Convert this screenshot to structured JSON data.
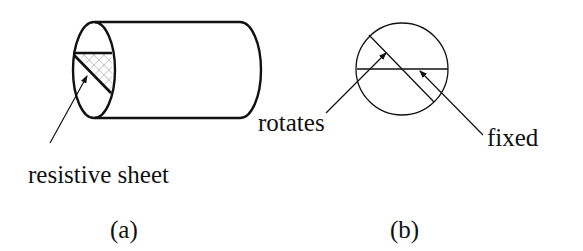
{
  "figure_a": {
    "callout": "resistive sheet",
    "caption": "(a)"
  },
  "figure_b": {
    "callout_rotating": "rotates",
    "callout_fixed": "fixed",
    "caption": "(b)"
  },
  "colors": {
    "stroke": "#111111",
    "hatch": "#8a8a8a",
    "background": "#ffffff"
  }
}
